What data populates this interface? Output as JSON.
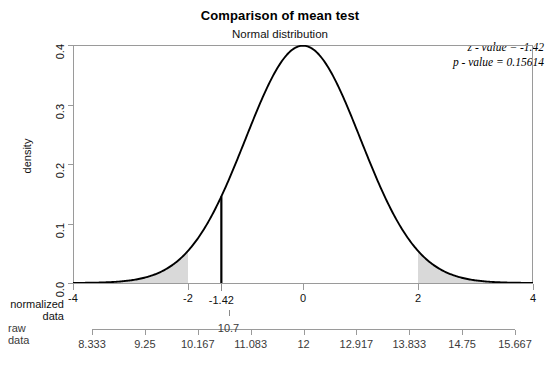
{
  "chart_data": {
    "type": "line",
    "title": "Comparison of mean test",
    "subtitle": "Normal distribution",
    "xlabel": "",
    "ylabel": "density",
    "distribution": "standard normal",
    "mean": 0,
    "sd": 1,
    "xlim": [
      -4,
      4
    ],
    "ylim": [
      0.0,
      0.4
    ],
    "grid": false,
    "legend": "none",
    "x_axis_primary": {
      "name": "normalized data",
      "ticks": [
        -4,
        -2,
        0,
        2,
        4
      ],
      "tick_labels": [
        "-4",
        "-2",
        "0",
        "2",
        "4"
      ],
      "extra_tick": -1.42,
      "extra_tick_label": "-1.42"
    },
    "x_axis_secondary": {
      "name": "raw data",
      "ticks": [
        8.333,
        9.25,
        10.167,
        11.083,
        12,
        12.917,
        13.833,
        14.75,
        15.667
      ],
      "tick_labels": [
        "8.333",
        "9.25",
        "10.167",
        "11.083",
        "12",
        "12.917",
        "13.833",
        "14.75",
        "15.667"
      ],
      "extra_tick": 10.7,
      "extra_tick_label": "10.7"
    },
    "y_axis": {
      "ticks": [
        0.0,
        0.1,
        0.2,
        0.3,
        0.4
      ],
      "tick_labels": [
        "0.0",
        "0.1",
        "0.2",
        "0.3",
        "0.4"
      ]
    },
    "shaded_regions": [
      {
        "name": "left-rejection-tail",
        "from": -4,
        "to": -2,
        "fill": "#d9d9d9"
      },
      {
        "name": "right-rejection-tail",
        "from": 2,
        "to": 4,
        "fill": "#d9d9d9"
      }
    ],
    "vertical_marker": {
      "name": "z-statistic-line",
      "x": -1.42,
      "y_top": 0.1456,
      "color": "#000000"
    },
    "curve_color": "#000000",
    "annotations": [
      {
        "name": "z-value",
        "text": "z - value = -1.42"
      },
      {
        "name": "p-value",
        "text": "p - value = 0.15614"
      }
    ]
  },
  "annotation": {
    "z_value": "z - value = -1.42",
    "p_value": "p - value = 0.15614"
  },
  "labels": {
    "normalized_data_line1": "normalized",
    "normalized_data_line2": "data",
    "raw_data_line1": "raw",
    "raw_data_line2": "data"
  }
}
